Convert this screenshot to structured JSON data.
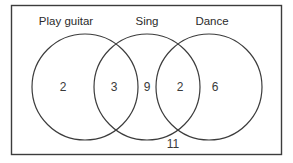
{
  "diagram": {
    "universe": {
      "name": "universal-set-box",
      "outside_count": "11"
    },
    "sets": [
      {
        "id": "play-guitar",
        "label": "Play guitar",
        "label_x": 66,
        "label_y": 22,
        "cx": 85,
        "cy": 87,
        "r": 53
      },
      {
        "id": "sing",
        "label": "Sing",
        "label_x": 147,
        "label_y": 22,
        "cx": 147,
        "cy": 87,
        "r": 53
      },
      {
        "id": "dance",
        "label": "Dance",
        "label_x": 212,
        "label_y": 22,
        "cx": 209,
        "cy": 87,
        "r": 53
      }
    ],
    "regions": [
      {
        "id": "guitar-only",
        "count": "2",
        "x": 63,
        "y": 88
      },
      {
        "id": "guitar-and-sing",
        "count": "3",
        "x": 114,
        "y": 88
      },
      {
        "id": "sing-only",
        "count": "9",
        "x": 147,
        "y": 88
      },
      {
        "id": "sing-and-dance",
        "count": "2",
        "x": 180,
        "y": 88
      },
      {
        "id": "dance-only",
        "count": "6",
        "x": 215,
        "y": 88
      },
      {
        "id": "outside-all-sets",
        "count": "11",
        "x": 173,
        "y": 145
      }
    ],
    "colors": {
      "stroke": "#3c3c3c",
      "text": "#2b2b2b",
      "number": "#3a3a3a",
      "background": "#ffffff"
    }
  }
}
